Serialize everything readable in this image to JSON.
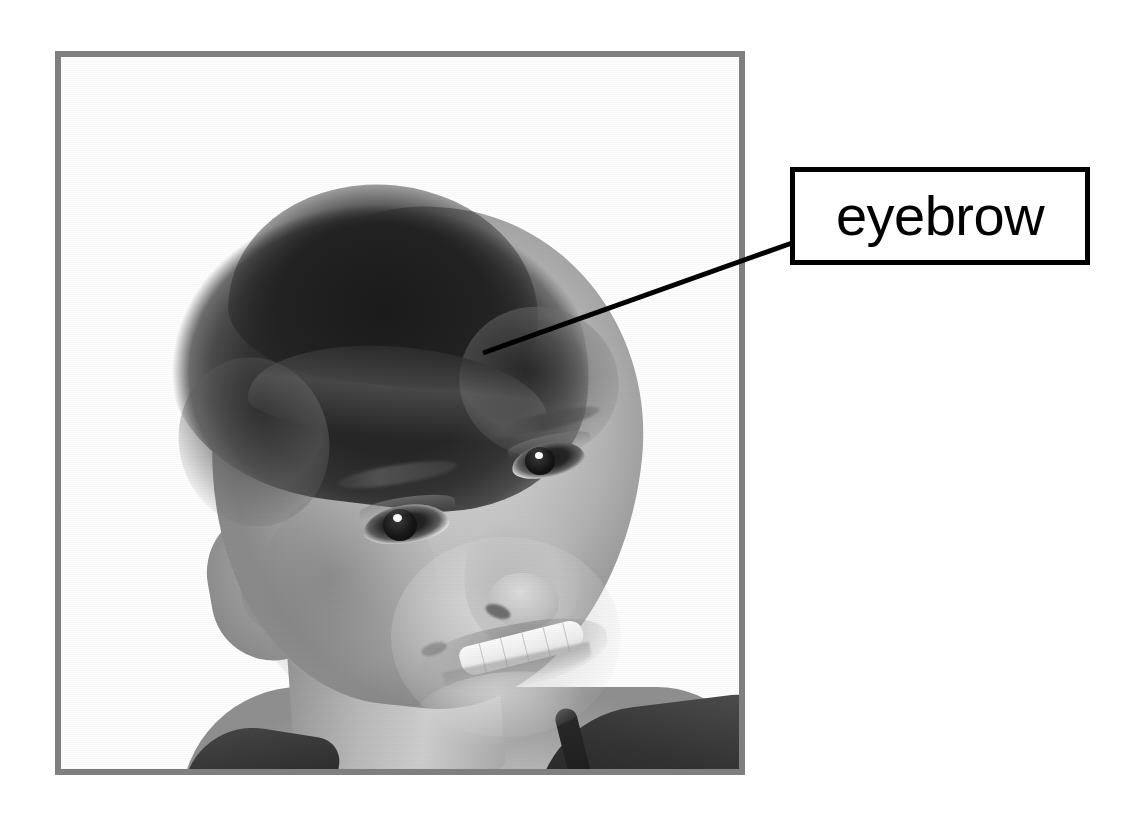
{
  "card": {
    "type": "anatomy-labeling-flashcard",
    "subject": "boy-portrait-black-and-white"
  },
  "frame": {
    "border_color": "#7f7f7f",
    "background_color": "#ffffff"
  },
  "photo": {
    "alt": "Black and white photograph of a smiling young boy with a short buzz cut haircut, head tilted slightly, wearing a dark sleeveless shirt",
    "palette": "grayscale",
    "features": [
      "buzz-cut-hair",
      "left-ear",
      "near-eye",
      "far-eye",
      "eyebrow",
      "nose",
      "smiling-mouth",
      "upper-teeth",
      "neck",
      "dark-shirt"
    ]
  },
  "callout": {
    "label": "eyebrow",
    "box_border_color": "#000000",
    "box_fill_color": "#ffffff",
    "line_color": "#000000",
    "pointer_target": "eyebrow",
    "line_start_x": 483,
    "line_start_y": 353,
    "line_end_x": 792,
    "line_end_y": 243
  }
}
